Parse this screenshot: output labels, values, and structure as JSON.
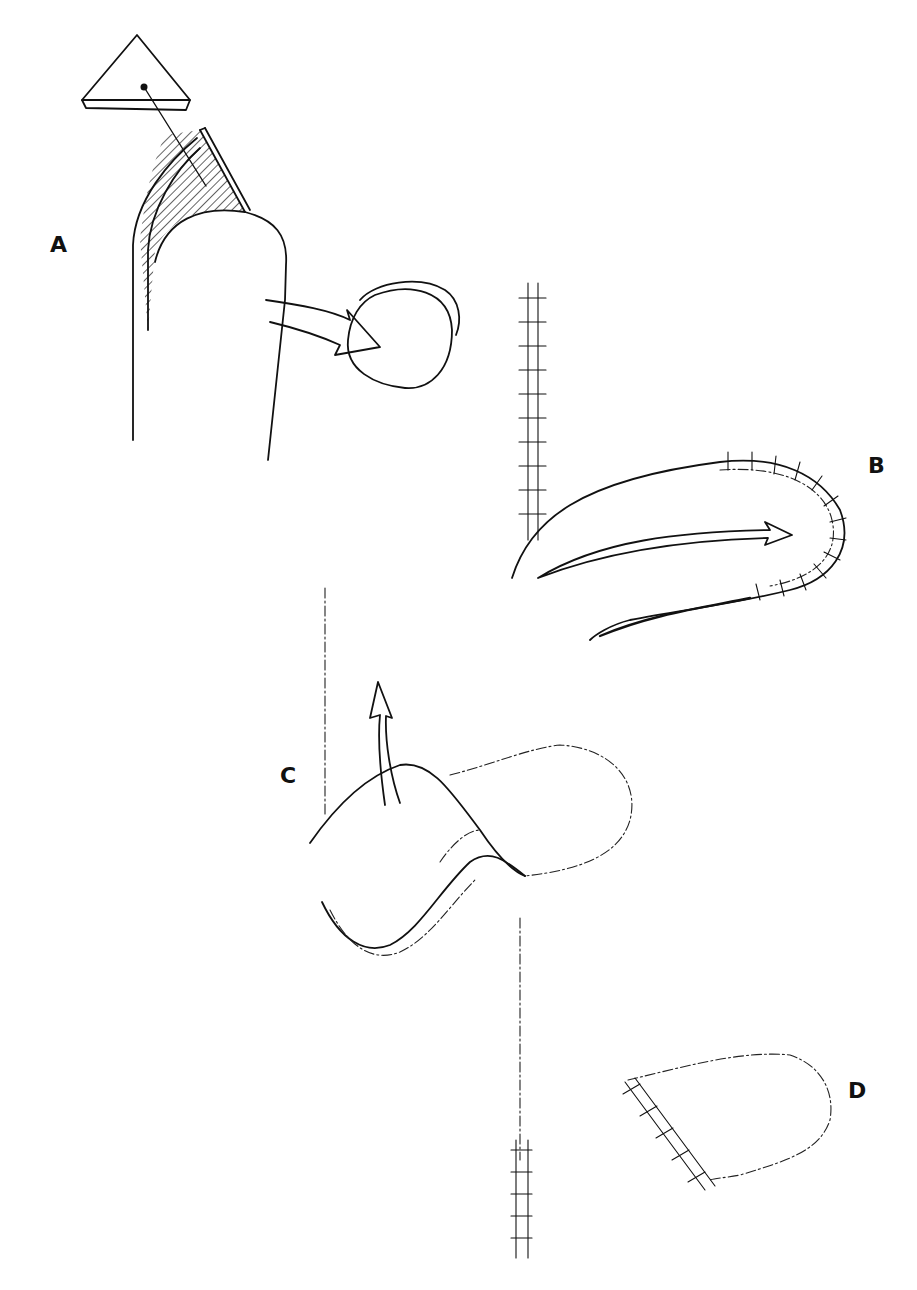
{
  "figure": {
    "panels": [
      {
        "id": "A",
        "label": "A",
        "description": "Triangular tissue wedge excised from digit tip; circular hatched defect"
      },
      {
        "id": "B",
        "label": "B",
        "description": "Flap rotated with sutured edges along incision"
      },
      {
        "id": "C",
        "label": "C",
        "description": "Flap elevated and transposed upward"
      },
      {
        "id": "D",
        "label": "D",
        "description": "Final sutured flap closure"
      }
    ],
    "colors": {
      "ink": "#111111",
      "background": "#ffffff"
    }
  }
}
